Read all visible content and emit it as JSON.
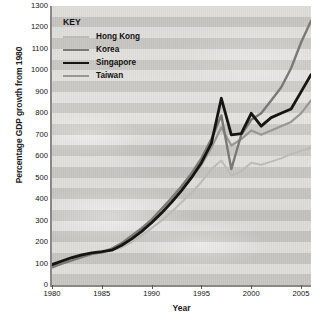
{
  "legend": {
    "title": "KEY",
    "entries": [
      {
        "label": "Hong Kong",
        "color": "#bdbbb7",
        "width": 2.0
      },
      {
        "label": "Korea",
        "color": "#7b7975",
        "width": 2.4
      },
      {
        "label": "Singapore",
        "color": "#16150f",
        "width": 2.8
      },
      {
        "label": "Taiwan",
        "color": "#9a9894",
        "width": 2.2
      }
    ]
  },
  "chart_data": {
    "type": "line",
    "title": "",
    "xlabel": "Year",
    "ylabel": "Percentage GDP growth from 1980",
    "xlim": [
      1980,
      2006
    ],
    "ylim": [
      0,
      1300
    ],
    "xticks": [
      1980,
      1985,
      1990,
      1995,
      2000,
      2005
    ],
    "yticks": [
      0,
      100,
      200,
      300,
      400,
      500,
      600,
      700,
      800,
      900,
      1000,
      1100,
      1200,
      1300
    ],
    "grid": "horizontal-bands",
    "legend_position": "top-left",
    "x": [
      1980,
      1981,
      1982,
      1983,
      1984,
      1985,
      1986,
      1987,
      1988,
      1989,
      1990,
      1991,
      1992,
      1993,
      1994,
      1995,
      1996,
      1997,
      1998,
      1999,
      2000,
      2001,
      2002,
      2003,
      2004,
      2005,
      2006
    ],
    "series": [
      {
        "name": "Hong Kong",
        "color": "#bdbbb7",
        "values": [
          90,
          105,
          118,
          128,
          142,
          150,
          162,
          175,
          200,
          230,
          265,
          300,
          340,
          385,
          430,
          480,
          540,
          580,
          510,
          530,
          570,
          560,
          575,
          590,
          610,
          625,
          640
        ]
      },
      {
        "name": "Korea",
        "color": "#7b7975",
        "values": [
          82,
          100,
          115,
          130,
          145,
          152,
          170,
          195,
          230,
          265,
          305,
          355,
          405,
          460,
          520,
          590,
          680,
          790,
          540,
          700,
          770,
          800,
          860,
          920,
          1010,
          1130,
          1230
        ]
      },
      {
        "name": "Singapore",
        "color": "#16150f",
        "values": [
          95,
          112,
          128,
          140,
          150,
          155,
          162,
          185,
          215,
          250,
          290,
          335,
          385,
          440,
          500,
          570,
          660,
          870,
          700,
          705,
          800,
          740,
          780,
          800,
          820,
          900,
          980
        ]
      },
      {
        "name": "Taiwan",
        "color": "#9a9894",
        "values": [
          88,
          103,
          120,
          133,
          146,
          152,
          168,
          190,
          222,
          258,
          295,
          340,
          390,
          445,
          500,
          560,
          640,
          735,
          650,
          680,
          720,
          700,
          720,
          740,
          760,
          800,
          860
        ]
      }
    ],
    "annotations": [
      {
        "text": "Asian financial crisis dip",
        "year": 1998
      }
    ]
  }
}
